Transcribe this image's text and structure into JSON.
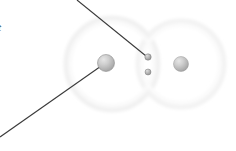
{
  "figure": {
    "background_color": "#ffffff",
    "width": 236,
    "height": 151,
    "labels": {
      "left_edge_label": "t"
    },
    "colors": {
      "sphere_fill_light": "#d8d8d8",
      "sphere_fill_mid": "#bdbdbd",
      "sphere_fill_dark": "#9a9a9a",
      "sphere_stroke": "#8f8f8f",
      "ring_stroke": "#f0f0f0",
      "ring_stroke_faint": "#f6f6f6",
      "leader_line": "#3a3a3a"
    },
    "rings": [
      {
        "name": "left-orbital-ring",
        "cx": 112,
        "cy": 64,
        "r": 46,
        "stroke_width": 5
      },
      {
        "name": "right-orbital-ring",
        "cx": 181,
        "cy": 64,
        "r": 43,
        "stroke_width": 5
      }
    ],
    "spheres": [
      {
        "name": "left-large-atom",
        "cx": 106,
        "cy": 63,
        "r": 8.5
      },
      {
        "name": "right-large-atom",
        "cx": 181,
        "cy": 64,
        "r": 7.5
      },
      {
        "name": "center-upper-small-atom",
        "cx": 148,
        "cy": 57,
        "r": 3.2
      },
      {
        "name": "center-lower-small-atom",
        "cx": 148,
        "cy": 72,
        "r": 3.0
      }
    ],
    "leader_lines": [
      {
        "name": "upper-leader-line",
        "x1": 77,
        "y1": 0,
        "x2": 146,
        "y2": 56,
        "stroke_width": 1.1
      },
      {
        "name": "lower-leader-line",
        "x1": 0,
        "y1": 137,
        "x2": 104,
        "y2": 64,
        "stroke_width": 1.1
      }
    ]
  }
}
